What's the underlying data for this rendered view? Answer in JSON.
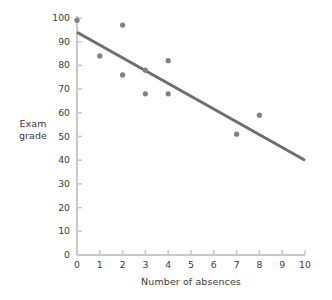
{
  "chart_data": {
    "type": "scatter",
    "title": "",
    "xlabel": "Number of absences",
    "ylabel": "Exam grade",
    "ylabel_lines": [
      "Exam",
      "grade"
    ],
    "xlim": [
      0,
      10
    ],
    "ylim": [
      0,
      100
    ],
    "xticks": [
      0,
      1,
      2,
      3,
      4,
      5,
      6,
      7,
      8,
      9,
      10
    ],
    "yticks": [
      0,
      10,
      20,
      30,
      40,
      50,
      60,
      70,
      80,
      90,
      100
    ],
    "xtick_labels": [
      "0",
      "1",
      "2",
      "3",
      "4",
      "5",
      "6",
      "7",
      "8",
      "9",
      "10"
    ],
    "ytick_labels": [
      "0",
      "10",
      "20",
      "30",
      "40",
      "50",
      "60",
      "70",
      "80",
      "90",
      "100"
    ],
    "grid": false,
    "legend": false,
    "points": [
      {
        "x": 0,
        "y": 99
      },
      {
        "x": 1,
        "y": 84
      },
      {
        "x": 2,
        "y": 97
      },
      {
        "x": 2,
        "y": 76
      },
      {
        "x": 3,
        "y": 78
      },
      {
        "x": 3,
        "y": 68
      },
      {
        "x": 4,
        "y": 82
      },
      {
        "x": 4,
        "y": 68
      },
      {
        "x": 7,
        "y": 51
      },
      {
        "x": 8,
        "y": 59
      }
    ],
    "trendline": {
      "x0": 0,
      "y0": 94,
      "x1": 10,
      "y1": 40
    },
    "colors": {
      "point": "#808080",
      "trendline": "#6e6e6e",
      "axis": "#c9c9c9",
      "text": "#3a3a3a",
      "background": "#ffffff"
    }
  }
}
